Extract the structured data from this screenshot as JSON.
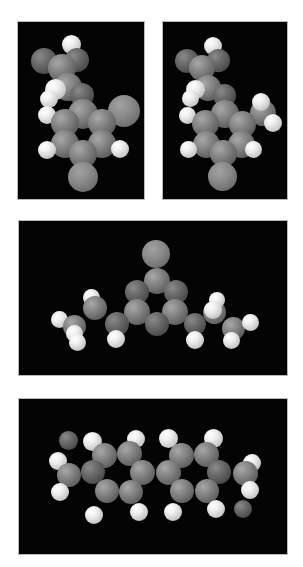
{
  "figure": {
    "panels": [
      {
        "id": "top-left",
        "view": "molecule view A"
      },
      {
        "id": "top-right",
        "view": "molecule view B"
      },
      {
        "id": "middle",
        "view": "molecule view C"
      },
      {
        "id": "bottom",
        "view": "molecule view D"
      }
    ]
  },
  "colors": {
    "background": "#ffffff",
    "panel": "#030303",
    "carbon": "#858585",
    "hydrogen": "#f0f0f0"
  }
}
